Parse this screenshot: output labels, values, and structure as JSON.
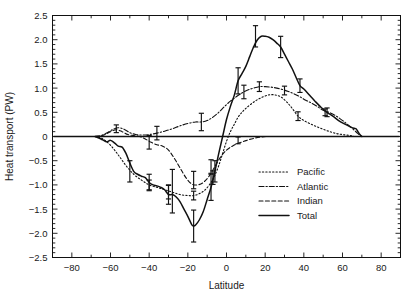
{
  "chart_data": {
    "type": "line",
    "title": "",
    "xlabel": "Latitude",
    "ylabel": "Heat transport (PW)",
    "xlim": [
      -90,
      90
    ],
    "ylim": [
      -2.5,
      2.5
    ],
    "xticks": [
      -80,
      -60,
      -40,
      -20,
      0,
      20,
      40,
      60,
      80
    ],
    "xtick_labels": [
      "−80",
      "−60",
      "−40",
      "−20",
      "0",
      "20",
      "40",
      "60",
      "80"
    ],
    "yticks": [
      -2.5,
      -2.0,
      -1.5,
      -1.0,
      -0.5,
      0,
      0.5,
      1.0,
      1.5,
      2.0,
      2.5
    ],
    "ytick_labels": [
      "−2.5",
      "−2.0",
      "−1.5",
      "−1.0",
      "−0.5",
      "0",
      "0.5",
      "1.0",
      "1.5",
      "2.0",
      "2.5"
    ],
    "grid": false,
    "legend_position": "lower-right",
    "zero_line": true,
    "series": [
      {
        "name": "Pacific",
        "style": "dotted",
        "dash": "1.3,2.1",
        "width": 1.1,
        "x": [
          -68,
          -64,
          -60,
          -56,
          -52,
          -48,
          -44,
          -40,
          -36,
          -32,
          -28,
          -24,
          -20,
          -17,
          -14,
          -11,
          -8,
          -6,
          -4,
          -2,
          0,
          2,
          4,
          6,
          8,
          10,
          13,
          16,
          19,
          22,
          25,
          28,
          31,
          34,
          37,
          40,
          44,
          48,
          52,
          56,
          60,
          64,
          66
        ],
        "y": [
          0.0,
          -0.05,
          -0.18,
          -0.38,
          -0.6,
          -0.78,
          -0.9,
          -1.0,
          -1.05,
          -1.1,
          -1.15,
          -1.2,
          -1.22,
          -1.22,
          -1.18,
          -1.1,
          -0.95,
          -0.8,
          -0.6,
          -0.35,
          -0.1,
          0.1,
          0.25,
          0.4,
          0.5,
          0.58,
          0.68,
          0.76,
          0.82,
          0.86,
          0.86,
          0.82,
          0.72,
          0.58,
          0.42,
          0.33,
          0.25,
          0.18,
          0.12,
          0.07,
          0.04,
          0.02,
          0.0
        ]
      },
      {
        "name": "Atlantic",
        "style": "dash-dot",
        "dash": "5,2,1.3,2",
        "width": 1.1,
        "x": [
          -68,
          -65,
          -62,
          -59,
          -56,
          -53,
          -50,
          -47,
          -44,
          -40,
          -36,
          -32,
          -28,
          -24,
          -20,
          -16,
          -13,
          -10,
          -7,
          -4,
          -1,
          2,
          5,
          8,
          11,
          14,
          17,
          20,
          23,
          26,
          29,
          32,
          35,
          38,
          41,
          44,
          47,
          50,
          53,
          56,
          59,
          62,
          65,
          68,
          70
        ],
        "y": [
          0.0,
          0.02,
          0.07,
          0.14,
          0.18,
          0.15,
          0.08,
          0.04,
          0.03,
          0.04,
          0.07,
          0.11,
          0.16,
          0.22,
          0.27,
          0.3,
          0.3,
          0.33,
          0.4,
          0.5,
          0.62,
          0.73,
          0.82,
          0.9,
          0.96,
          1.0,
          1.03,
          1.03,
          1.02,
          1.0,
          0.97,
          0.93,
          0.88,
          0.82,
          0.75,
          0.69,
          0.62,
          0.54,
          0.5,
          0.44,
          0.36,
          0.27,
          0.17,
          0.06,
          0.0
        ]
      },
      {
        "name": "Indian",
        "style": "dashed",
        "dash": "4,2.4",
        "width": 1.1,
        "x": [
          -68,
          -64,
          -60,
          -57,
          -54,
          -51,
          -48,
          -45,
          -42,
          -39,
          -36,
          -33,
          -30,
          -27,
          -24,
          -21,
          -18,
          -15,
          -12,
          -9,
          -6,
          -3,
          0,
          3,
          6,
          9,
          12,
          15,
          18,
          21,
          24,
          26
        ],
        "y": [
          0.0,
          0.02,
          0.1,
          0.14,
          0.1,
          0.04,
          0.02,
          0.0,
          -0.05,
          -0.12,
          -0.17,
          -0.2,
          -0.28,
          -0.45,
          -0.65,
          -0.85,
          -0.98,
          -1.0,
          -0.95,
          -0.82,
          -0.62,
          -0.42,
          -0.28,
          -0.2,
          -0.14,
          -0.1,
          -0.06,
          -0.03,
          -0.01,
          0.0,
          0.0,
          0.0
        ]
      },
      {
        "name": "Total",
        "style": "solid",
        "dash": "",
        "width": 1.5,
        "x": [
          -68,
          -66,
          -64,
          -62,
          -60,
          -58,
          -56,
          -54,
          -52,
          -50,
          -48,
          -46,
          -44,
          -42,
          -40,
          -38,
          -36,
          -34,
          -32,
          -30,
          -28,
          -26,
          -24,
          -22,
          -20,
          -18,
          -17,
          -16,
          -14,
          -12,
          -10,
          -8,
          -6,
          -4,
          -2,
          0,
          2,
          4,
          6,
          8,
          10,
          12,
          14,
          16,
          18,
          20,
          22,
          24,
          26,
          28,
          30,
          32,
          34,
          36,
          38,
          40,
          43,
          46,
          49,
          52,
          55,
          58,
          61,
          64,
          66,
          67,
          68,
          69,
          70
        ],
        "y": [
          0.0,
          -0.03,
          -0.07,
          -0.11,
          -0.08,
          -0.13,
          -0.2,
          -0.22,
          -0.35,
          -0.55,
          -0.72,
          -0.78,
          -0.82,
          -0.85,
          -0.95,
          -1.0,
          -1.02,
          -1.05,
          -1.1,
          -1.2,
          -1.2,
          -1.25,
          -1.35,
          -1.5,
          -1.65,
          -1.82,
          -1.85,
          -1.83,
          -1.72,
          -1.55,
          -1.3,
          -1.05,
          -0.72,
          -0.35,
          0.0,
          0.35,
          0.62,
          0.85,
          1.15,
          1.3,
          1.45,
          1.65,
          1.85,
          2.0,
          2.07,
          2.07,
          2.05,
          2.0,
          1.93,
          1.85,
          1.7,
          1.55,
          1.4,
          1.22,
          1.05,
          0.98,
          0.85,
          0.72,
          0.6,
          0.5,
          0.42,
          0.33,
          0.26,
          0.2,
          0.17,
          0.16,
          0.1,
          0.04,
          0.0
        ]
      }
    ],
    "errorbars": [
      {
        "series": "Total",
        "x": -50,
        "y": -0.72,
        "err": 0.22
      },
      {
        "series": "Total",
        "x": -40,
        "y": -0.95,
        "err": 0.17
      },
      {
        "series": "Total",
        "x": -30,
        "y": -1.2,
        "err": 0.2
      },
      {
        "series": "Total",
        "x": -28,
        "y": -1.13,
        "err": 0.45
      },
      {
        "series": "Total",
        "x": -17,
        "y": -1.85,
        "err": 0.33
      },
      {
        "series": "Total",
        "x": -8,
        "y": -1.05,
        "err": 0.27
      },
      {
        "series": "Total",
        "x": -6,
        "y": -0.72,
        "err": 0.22
      },
      {
        "series": "Total",
        "x": 6,
        "y": 1.15,
        "err": 0.27
      },
      {
        "series": "Total",
        "x": 15,
        "y": 2.07,
        "err": 0.22
      },
      {
        "series": "Total",
        "x": 28,
        "y": 1.85,
        "err": 0.22
      },
      {
        "series": "Total",
        "x": 38,
        "y": 1.05,
        "err": 0.14
      },
      {
        "series": "Total",
        "x": 52,
        "y": 0.5,
        "err": 0.09
      },
      {
        "series": "Atlantic",
        "x": -57,
        "y": 0.16,
        "err": 0.08
      },
      {
        "series": "Atlantic",
        "x": -36,
        "y": 0.07,
        "err": 0.14
      },
      {
        "series": "Atlantic",
        "x": -13,
        "y": 0.3,
        "err": 0.18
      },
      {
        "series": "Atlantic",
        "x": 9,
        "y": 0.92,
        "err": 0.14
      },
      {
        "series": "Atlantic",
        "x": 17,
        "y": 1.03,
        "err": 0.1
      },
      {
        "series": "Atlantic",
        "x": 30,
        "y": 0.95,
        "err": 0.09
      },
      {
        "series": "Atlantic",
        "x": 51,
        "y": 0.5,
        "err": 0.07
      },
      {
        "series": "Indian",
        "x": -40,
        "y": -0.12,
        "err": 0.14
      },
      {
        "series": "Indian",
        "x": -17,
        "y": -0.9,
        "err": 0.18
      },
      {
        "series": "Indian",
        "x": -8,
        "y": -0.62,
        "err": 0.14
      },
      {
        "series": "Indian",
        "x": 6,
        "y": -0.08,
        "err": 0.07
      },
      {
        "series": "Pacific",
        "x": -40,
        "y": -1.0,
        "err": 0.1
      },
      {
        "series": "Pacific",
        "x": -30,
        "y": -1.15,
        "err": 0.14
      },
      {
        "series": "Pacific",
        "x": -17,
        "y": -1.22,
        "err": 0.09
      },
      {
        "series": "Pacific",
        "x": -7,
        "y": -0.85,
        "err": 0.14
      },
      {
        "series": "Pacific",
        "x": 37,
        "y": 0.42,
        "err": 0.09
      }
    ]
  },
  "legend": {
    "items": [
      {
        "label": "Pacific",
        "style": "dotted"
      },
      {
        "label": "Atlantic",
        "style": "dash-dot"
      },
      {
        "label": "Indian",
        "style": "dashed"
      },
      {
        "label": "Total",
        "style": "solid"
      }
    ]
  },
  "colors": {
    "ink": "#111111",
    "background": "#ffffff"
  }
}
